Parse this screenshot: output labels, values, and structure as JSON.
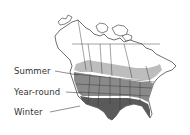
{
  "map": {
    "type": "species-range-map",
    "region": "North America",
    "zones": [
      {
        "id": "summer",
        "label": "Summer",
        "color": "#bdbdbd"
      },
      {
        "id": "year_round",
        "label": "Year-round",
        "color": "#8a8a8a"
      },
      {
        "id": "winter",
        "label": "Winter",
        "color": "#5a5a5a"
      }
    ],
    "outline_color": "#333333",
    "background": "#ffffff"
  },
  "legend": {
    "summer": "Summer",
    "year_round": "Year-round",
    "winter": "Winter"
  }
}
